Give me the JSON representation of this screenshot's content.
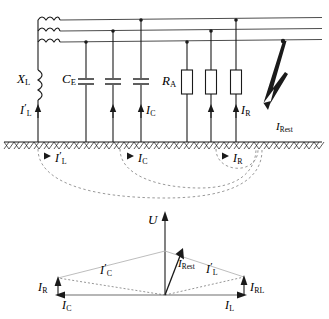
{
  "figure": {
    "colors": {
      "line": "#1a1a1a",
      "grey_line": "#808080",
      "dashed": "#9a9a9a",
      "background": "#ffffff"
    }
  },
  "circuit": {
    "components": [
      {
        "id": "petersen-coil",
        "symbol": "inductor",
        "label": "X",
        "sub": "L",
        "prime": false
      },
      {
        "id": "earth-capacitance",
        "symbol": "capacitor",
        "label": "C",
        "sub": "E",
        "prime": false
      },
      {
        "id": "leakage-resistance",
        "symbol": "resistor",
        "label": "R",
        "sub": "A",
        "prime": false
      }
    ],
    "branch_currents": [
      {
        "id": "coil-current",
        "label": "I",
        "sub": "L",
        "prime": true
      },
      {
        "id": "capacitive-current",
        "label": "I",
        "sub": "C",
        "prime": false
      },
      {
        "id": "resistive-current",
        "label": "I",
        "sub": "R",
        "prime": false
      },
      {
        "id": "residual-current",
        "label": "I",
        "sub": "Rest",
        "prime": false
      }
    ],
    "ground_return_currents": [
      {
        "id": "ground-coil-current",
        "label": "I",
        "sub": "L",
        "prime": true
      },
      {
        "id": "ground-capacitive-current",
        "label": "I",
        "sub": "C",
        "prime": false
      },
      {
        "id": "ground-resistive-current",
        "label": "I",
        "sub": "R",
        "prime": false
      }
    ],
    "phase_lines": 3,
    "capacitor_count": 3,
    "resistor_count": 3,
    "fault": {
      "id": "arc-fault",
      "symbol": "lightning-arc",
      "label": "I",
      "sub": "Rest"
    }
  },
  "phasor": {
    "axis": {
      "id": "voltage-axis",
      "label": "U",
      "direction": "up"
    },
    "vectors": [
      {
        "id": "vector-capacitive",
        "label": "I",
        "sub": "C",
        "prime": false,
        "style": "solid",
        "direction": "left"
      },
      {
        "id": "vector-inductive",
        "label": "I",
        "sub": "L",
        "prime": false,
        "style": "solid",
        "direction": "right"
      },
      {
        "id": "vector-resistive",
        "label": "I",
        "sub": "R",
        "prime": false,
        "style": "solid",
        "direction": "up"
      },
      {
        "id": "vector-resistive-line",
        "label": "I",
        "sub": "RL",
        "prime": false,
        "style": "solid",
        "direction": "up"
      },
      {
        "id": "vector-capacitive-total",
        "label": "I",
        "sub": "C",
        "prime": true,
        "style": "dashed",
        "direction": "upper-left"
      },
      {
        "id": "vector-inductive-total",
        "label": "I",
        "sub": "L",
        "prime": true,
        "style": "dashed",
        "direction": "upper-right"
      },
      {
        "id": "vector-residual",
        "label": "I",
        "sub": "Rest",
        "prime": false,
        "style": "solid",
        "direction": "up-slight-right"
      }
    ]
  }
}
